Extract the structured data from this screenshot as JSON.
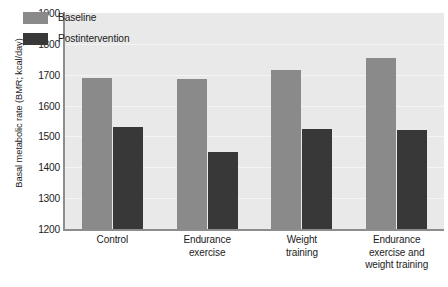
{
  "chart_data": {
    "type": "bar",
    "title": "",
    "xlabel": "",
    "ylabel": "Basal metabolic rate (BMR; kcal/day)",
    "ylim": [
      1200,
      1900
    ],
    "ytick_step": 100,
    "yticks": [
      1900,
      1800,
      1700,
      1600,
      1500,
      1400,
      1300,
      1200
    ],
    "ytick_labels": [
      "1900",
      "1800",
      "1700",
      "1600",
      "1500",
      "1400",
      "1300",
      "1200"
    ],
    "grid": true,
    "legend_position": "top-left-inside",
    "categories": [
      "Control",
      "Endurance exercise",
      "Weight training",
      "Endurance exercise and weight training"
    ],
    "category_lines": [
      [
        "Control"
      ],
      [
        "Endurance",
        "exercise"
      ],
      [
        "Weight",
        "training"
      ],
      [
        "Endurance",
        "exercise and",
        "weight training"
      ]
    ],
    "series": [
      {
        "name": "Baseline",
        "color": "#8a8a8a",
        "values": [
          1690,
          1685,
          1715,
          1755
        ]
      },
      {
        "name": "Postintervention",
        "color": "#383838",
        "values": [
          1530,
          1450,
          1525,
          1520
        ]
      }
    ]
  },
  "colors": {
    "plot_background": "#e9e9e9",
    "page_background": "#ffffff",
    "axis": "#8d8d8d",
    "gridline": "#f4f4f4",
    "text": "#1c1c1c",
    "baseline_bar": "#8a8a8a",
    "postintervention_bar": "#383838"
  }
}
